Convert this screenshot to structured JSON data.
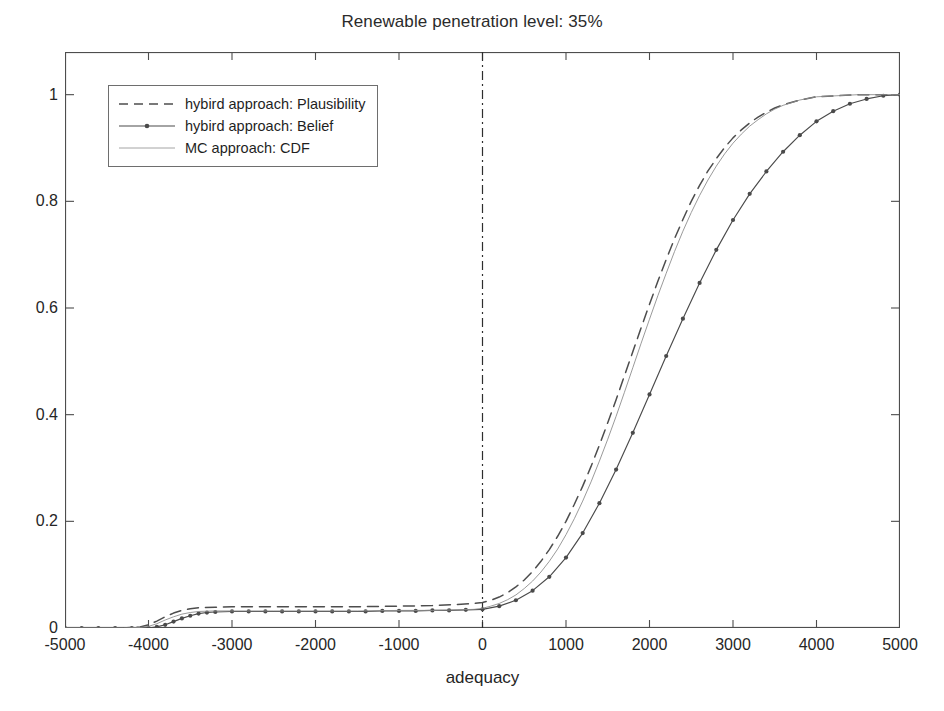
{
  "chart_data": {
    "type": "line",
    "title": "Renewable penetration level: 35%",
    "xlabel": "adequacy",
    "ylabel": "",
    "xlim": [
      -5000,
      5000
    ],
    "ylim": [
      0,
      1.08
    ],
    "xticks": [
      -5000,
      -4000,
      -3000,
      -2000,
      -1000,
      0,
      1000,
      2000,
      3000,
      4000,
      5000
    ],
    "xtick_labels": [
      "-5000",
      "-4000",
      "-3000",
      "-2000",
      "-1000",
      "0",
      "1000",
      "2000",
      "3000",
      "4000",
      "5000"
    ],
    "yticks": [
      0,
      0.2,
      0.4,
      0.6,
      0.8,
      1
    ],
    "ytick_labels": [
      "0",
      "0.2",
      "0.4",
      "0.6",
      "0.8",
      "1"
    ],
    "grid": false,
    "legend_position": "upper left",
    "annotations": [
      {
        "name": "vertical-reference-line",
        "type": "vline",
        "x": 0,
        "style": "dash-dot"
      }
    ],
    "series": [
      {
        "name": "hybird approach: Plausibility",
        "style": "dashed",
        "color": "#4d4d4d",
        "marker": "none",
        "x": [
          -5000,
          -4600,
          -4300,
          -4100,
          -4000,
          -3900,
          -3800,
          -3700,
          -3600,
          -3500,
          -3400,
          -3200,
          -3000,
          -2500,
          -2000,
          -1500,
          -1000,
          -600,
          -300,
          -100,
          0,
          100,
          200,
          300,
          400,
          500,
          600,
          700,
          800,
          900,
          1000,
          1100,
          1200,
          1300,
          1400,
          1500,
          1600,
          1700,
          1800,
          1900,
          2000,
          2100,
          2200,
          2300,
          2400,
          2500,
          2600,
          2700,
          2800,
          2900,
          3000,
          3100,
          3200,
          3300,
          3400,
          3500,
          3600,
          3800,
          4000,
          4500,
          5000
        ],
        "y": [
          0.0,
          0.0,
          0.0,
          0.002,
          0.006,
          0.013,
          0.021,
          0.028,
          0.033,
          0.036,
          0.038,
          0.039,
          0.04,
          0.04,
          0.04,
          0.04,
          0.041,
          0.042,
          0.044,
          0.046,
          0.048,
          0.052,
          0.058,
          0.066,
          0.077,
          0.09,
          0.106,
          0.125,
          0.147,
          0.172,
          0.2,
          0.232,
          0.266,
          0.303,
          0.343,
          0.385,
          0.428,
          0.473,
          0.518,
          0.563,
          0.607,
          0.65,
          0.691,
          0.73,
          0.766,
          0.8,
          0.83,
          0.857,
          0.88,
          0.901,
          0.919,
          0.934,
          0.947,
          0.958,
          0.967,
          0.975,
          0.981,
          0.99,
          0.996,
          1.0,
          1.0
        ]
      },
      {
        "name": "hybird approach: Belief",
        "style": "solid",
        "color": "#4a4a4a",
        "marker": "dot",
        "x": [
          -5000,
          -4800,
          -4600,
          -4400,
          -4200,
          -4000,
          -3900,
          -3800,
          -3700,
          -3600,
          -3500,
          -3400,
          -3300,
          -3200,
          -3000,
          -2800,
          -2600,
          -2400,
          -2200,
          -2000,
          -1800,
          -1600,
          -1400,
          -1200,
          -1000,
          -800,
          -600,
          -400,
          -200,
          0,
          200,
          400,
          600,
          800,
          1000,
          1200,
          1400,
          1600,
          1800,
          2000,
          2200,
          2400,
          2600,
          2800,
          3000,
          3200,
          3400,
          3600,
          3800,
          4000,
          4200,
          4400,
          4600,
          4800,
          5000
        ],
        "y": [
          0.0,
          0.0,
          0.0,
          0.0,
          0.0,
          0.0,
          0.002,
          0.006,
          0.012,
          0.018,
          0.023,
          0.027,
          0.029,
          0.03,
          0.031,
          0.031,
          0.031,
          0.031,
          0.031,
          0.031,
          0.031,
          0.031,
          0.031,
          0.032,
          0.032,
          0.032,
          0.033,
          0.033,
          0.034,
          0.035,
          0.041,
          0.052,
          0.07,
          0.096,
          0.132,
          0.178,
          0.234,
          0.297,
          0.366,
          0.438,
          0.51,
          0.58,
          0.647,
          0.709,
          0.765,
          0.814,
          0.856,
          0.893,
          0.924,
          0.95,
          0.969,
          0.983,
          0.992,
          0.998,
          1.0
        ]
      },
      {
        "name": "MC approach: CDF",
        "style": "thin-solid",
        "color": "#8f8f8f",
        "marker": "none",
        "x": [
          -5000,
          -4600,
          -4300,
          -4100,
          -4000,
          -3900,
          -3800,
          -3700,
          -3600,
          -3500,
          -3400,
          -3200,
          -3000,
          -2500,
          -2000,
          -1500,
          -1000,
          -600,
          -300,
          -100,
          0,
          100,
          200,
          300,
          400,
          500,
          600,
          700,
          800,
          900,
          1000,
          1100,
          1200,
          1300,
          1400,
          1500,
          1600,
          1700,
          1800,
          1900,
          2000,
          2100,
          2200,
          2300,
          2400,
          2500,
          2600,
          2700,
          2800,
          2900,
          3000,
          3100,
          3200,
          3300,
          3400,
          3500,
          3600,
          3800,
          4000,
          4500,
          5000
        ],
        "y": [
          0.0,
          0.0,
          0.0,
          0.001,
          0.003,
          0.008,
          0.015,
          0.021,
          0.026,
          0.029,
          0.031,
          0.032,
          0.032,
          0.032,
          0.032,
          0.032,
          0.033,
          0.033,
          0.034,
          0.035,
          0.037,
          0.041,
          0.046,
          0.053,
          0.062,
          0.074,
          0.088,
          0.105,
          0.125,
          0.148,
          0.175,
          0.205,
          0.238,
          0.274,
          0.313,
          0.354,
          0.397,
          0.442,
          0.488,
          0.534,
          0.579,
          0.623,
          0.665,
          0.706,
          0.744,
          0.779,
          0.811,
          0.84,
          0.866,
          0.889,
          0.909,
          0.926,
          0.941,
          0.953,
          0.964,
          0.973,
          0.98,
          0.99,
          0.996,
          1.0,
          1.0
        ]
      }
    ]
  },
  "legend": {
    "entries": [
      {
        "label": "hybird approach: Plausibility",
        "style": "dashed"
      },
      {
        "label": "hybird approach: Belief",
        "style": "solid-dot"
      },
      {
        "label": "MC approach: CDF",
        "style": "thin-solid"
      }
    ]
  },
  "colors": {
    "axis": "#4d4d4d",
    "plausibility": "#4d4d4d",
    "belief": "#4a4a4a",
    "mc_cdf": "#8f8f8f",
    "reference_line": "#2e2e2e",
    "background": "#ffffff"
  }
}
